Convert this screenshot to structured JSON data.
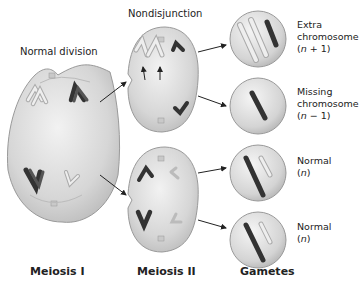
{
  "diagram": {
    "title_labels": {
      "normal_division": "Normal division",
      "nondisjunction": "Nondisjunction"
    },
    "stages": [
      {
        "id": "meiosis-1",
        "label": "Meiosis I"
      },
      {
        "id": "meiosis-2",
        "label": "Meiosis II"
      },
      {
        "id": "gametes",
        "label": "Gametes"
      }
    ],
    "gametes": [
      {
        "line1": "Extra",
        "line2": "chromosome",
        "formula_open": "(",
        "n": "n",
        "formula_rest": " + 1)"
      },
      {
        "line1": "Missing",
        "line2": "chromosome",
        "formula_open": "(",
        "n": "n",
        "formula_rest": " − 1)"
      },
      {
        "line1": "Normal",
        "line2": "",
        "formula_open": "(",
        "n": "n",
        "formula_rest": ")"
      },
      {
        "line1": "Normal",
        "line2": "",
        "formula_open": "(",
        "n": "n",
        "formula_rest": ")"
      }
    ],
    "colors": {
      "cell_fill": "#d9d9d9",
      "cell_stroke": "#9a9a9a",
      "dark_chromosome": "#4a4a4a",
      "light_chromosome": "#eeeeee",
      "arrow": "#222222"
    }
  }
}
